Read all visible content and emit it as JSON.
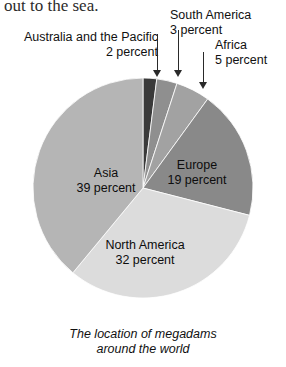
{
  "page": {
    "clipped_text_above": "out to the sea.",
    "background_color": "#ffffff"
  },
  "caption": {
    "line1": "The location of megadams",
    "line2": "around the world"
  },
  "callouts": [
    {
      "name": "australia-and-the-pacific",
      "line1": "Australia and the Pacific",
      "line2": "2 percent",
      "arrow": "down-arrow-icon"
    },
    {
      "name": "south-america",
      "line1": "South America",
      "line2": "3 percent",
      "arrow": "down-arrow-icon"
    },
    {
      "name": "africa",
      "line1": "Africa",
      "line2": "5 percent",
      "arrow": "down-arrow-icon"
    }
  ],
  "inner_labels": [
    {
      "name": "asia",
      "line1": "Asia",
      "line2": "39 percent"
    },
    {
      "name": "europe",
      "line1": "Europe",
      "line2": "19 percent"
    },
    {
      "name": "north-america",
      "line1": "North America",
      "line2": "32 percent"
    }
  ],
  "chart_data": {
    "type": "pie",
    "title": "The location of megadams around the world",
    "unit": "percent",
    "start_angle_deg": 0,
    "direction": "clockwise",
    "center": [
      110,
      110
    ],
    "radius": 110,
    "labels": [
      "Australia and the Pacific",
      "South America",
      "Africa",
      "Europe",
      "North America",
      "Asia"
    ],
    "values": [
      2,
      3,
      5,
      19,
      32,
      39
    ],
    "value_texts": [
      "2 percent",
      "3 percent",
      "5 percent",
      "19 percent",
      "32 percent",
      "39 percent"
    ],
    "colors": [
      "#3a3a3a",
      "#8f8f8f",
      "#a2a2a2",
      "#898989",
      "#dcdcdc",
      "#b5b5b5"
    ],
    "label_placement": [
      "callout",
      "callout",
      "callout",
      "inside",
      "inside",
      "inside"
    ],
    "legend": "none",
    "grid": false
  }
}
